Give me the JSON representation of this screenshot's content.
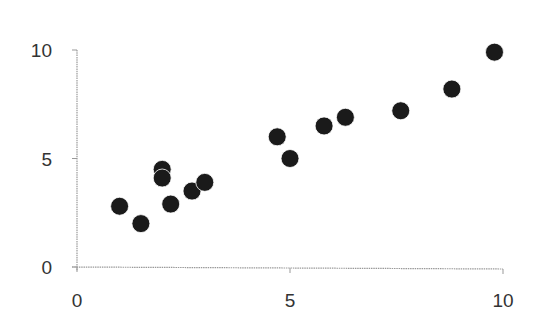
{
  "chart_data": {
    "type": "scatter",
    "title": "",
    "xlabel": "",
    "ylabel": "",
    "xlim": [
      0,
      10
    ],
    "ylim": [
      0,
      10
    ],
    "x_ticks": [
      0,
      5,
      10
    ],
    "y_ticks": [
      0,
      5,
      10
    ],
    "x_tick_labels": [
      "0",
      "5",
      "10"
    ],
    "y_tick_labels": [
      "0",
      "5",
      "10"
    ],
    "grid": false,
    "legend": null,
    "series": [
      {
        "name": "Series 1",
        "color": "#1a1a1a",
        "points": [
          {
            "x": 1.0,
            "y": 2.8
          },
          {
            "x": 1.5,
            "y": 2.0
          },
          {
            "x": 2.0,
            "y": 4.5
          },
          {
            "x": 2.0,
            "y": 4.1
          },
          {
            "x": 2.2,
            "y": 2.9
          },
          {
            "x": 2.7,
            "y": 3.5
          },
          {
            "x": 3.0,
            "y": 3.9
          },
          {
            "x": 4.7,
            "y": 6.0
          },
          {
            "x": 5.0,
            "y": 5.0
          },
          {
            "x": 5.8,
            "y": 6.5
          },
          {
            "x": 6.3,
            "y": 6.9
          },
          {
            "x": 7.6,
            "y": 7.2
          },
          {
            "x": 8.8,
            "y": 8.2
          },
          {
            "x": 9.8,
            "y": 9.9
          }
        ]
      }
    ]
  },
  "style": {
    "axis_color": "#999999",
    "marker_color": "#1a1a1a",
    "label_color": "#333333"
  }
}
